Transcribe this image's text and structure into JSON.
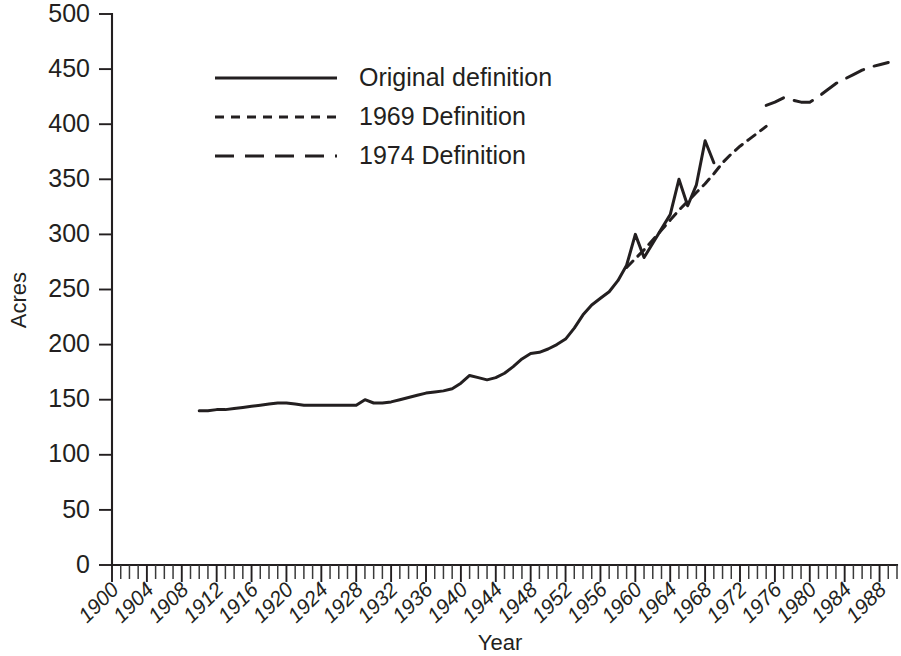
{
  "chart_data": {
    "type": "line",
    "title": "",
    "xlabel": "Year",
    "ylabel": "Acres",
    "xlim": [
      1900,
      1990
    ],
    "ylim": [
      0,
      500
    ],
    "y_ticks": [
      0,
      50,
      100,
      150,
      200,
      250,
      300,
      350,
      400,
      450,
      500
    ],
    "y_tick_labels": [
      "0",
      "50",
      "100",
      "150",
      "200",
      "250",
      "300",
      "350",
      "400",
      "450",
      "500"
    ],
    "x_ticks": [
      1900,
      1904,
      1908,
      1912,
      1916,
      1920,
      1924,
      1928,
      1932,
      1936,
      1940,
      1944,
      1948,
      1952,
      1956,
      1960,
      1964,
      1968,
      1972,
      1976,
      1980,
      1984,
      1988
    ],
    "x_tick_labels": [
      "1900",
      "1904",
      "1908",
      "1912",
      "1916",
      "1920",
      "1924",
      "1928",
      "1932",
      "1936",
      "1940",
      "1944",
      "1948",
      "1952",
      "1956",
      "1960",
      "1964",
      "1968",
      "1972",
      "1976",
      "1980",
      "1984",
      "1988"
    ],
    "x_minor_tick_interval": 1,
    "grid": false,
    "legend_position": "upper-left-inset",
    "series": [
      {
        "name": "Original definition",
        "dash": "solid",
        "x": [
          1910,
          1911,
          1912,
          1913,
          1914,
          1915,
          1916,
          1917,
          1918,
          1919,
          1920,
          1921,
          1922,
          1923,
          1924,
          1925,
          1926,
          1927,
          1928,
          1929,
          1930,
          1931,
          1932,
          1933,
          1934,
          1935,
          1936,
          1937,
          1938,
          1939,
          1940,
          1941,
          1942,
          1943,
          1944,
          1945,
          1946,
          1947,
          1948,
          1949,
          1950,
          1951,
          1952,
          1953,
          1954,
          1955,
          1956,
          1957,
          1958,
          1959,
          1960,
          1961,
          1962,
          1963,
          1964,
          1965,
          1966,
          1967,
          1968,
          1969
        ],
        "values": [
          140,
          140,
          141,
          141,
          142,
          143,
          144,
          145,
          146,
          147,
          147,
          146,
          145,
          145,
          145,
          145,
          145,
          145,
          145,
          150,
          147,
          147,
          148,
          150,
          152,
          154,
          156,
          157,
          158,
          160,
          165,
          172,
          170,
          168,
          170,
          174,
          180,
          187,
          192,
          193,
          196,
          200,
          205,
          215,
          227,
          236,
          242,
          248,
          258,
          272,
          300,
          279,
          292,
          305,
          318,
          350,
          326,
          345,
          385,
          365
        ]
      },
      {
        "name": "1969 Definition",
        "dash": "short-dash",
        "x": [
          1959,
          1960,
          1961,
          1962,
          1963,
          1964,
          1965,
          1966,
          1967,
          1968,
          1969,
          1970,
          1971,
          1972,
          1973,
          1974,
          1975
        ],
        "values": [
          270,
          278,
          286,
          295,
          304,
          313,
          322,
          330,
          338,
          346,
          355,
          365,
          373,
          380,
          386,
          392,
          398
        ]
      },
      {
        "name": "1974 Definition",
        "dash": "long-dash",
        "x": [
          1975,
          1976,
          1977,
          1978,
          1979,
          1980,
          1981,
          1982,
          1983,
          1984,
          1985,
          1986,
          1987,
          1988,
          1989
        ],
        "values": [
          417,
          420,
          424,
          422,
          420,
          420,
          425,
          431,
          437,
          441,
          445,
          449,
          452,
          454,
          456
        ]
      }
    ],
    "legend": [
      {
        "label": "Original definition",
        "dash": "solid"
      },
      {
        "label": "1969 Definition",
        "dash": "short-dash"
      },
      {
        "label": "1974 Definition",
        "dash": "long-dash"
      }
    ],
    "colors": {
      "line": "#231f20",
      "axis": "#231f20",
      "text": "#231f20",
      "background": "#ffffff"
    }
  }
}
